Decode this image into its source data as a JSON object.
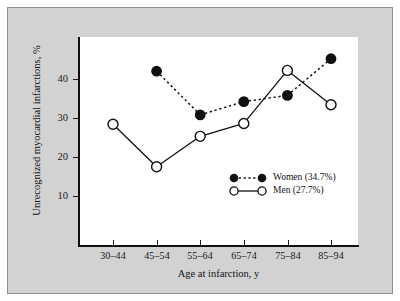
{
  "chart_data": {
    "type": "line",
    "title": "",
    "xlabel": "Age at infarction, y",
    "ylabel": "Unrecognized myocardial infarctions, %",
    "categories": [
      "30–44",
      "45–54",
      "55–64",
      "65–74",
      "75–84",
      "85–94"
    ],
    "yticks": [
      10,
      20,
      30,
      40
    ],
    "ylim": [
      0,
      50
    ],
    "grid": false,
    "legend_position": "inside-right-lower",
    "series": [
      {
        "name": "Women (34.7%)",
        "short_name": "Women",
        "overall": "34.7%",
        "marker": "filled-circle",
        "linestyle": "dotted",
        "color": "#111111",
        "values": [
          null,
          42.0,
          30.8,
          34.2,
          35.8,
          45.2
        ]
      },
      {
        "name": "Men (27.7%)",
        "short_name": "Men",
        "overall": "27.7%",
        "marker": "open-circle",
        "linestyle": "solid",
        "color": "#111111",
        "values": [
          28.4,
          17.5,
          25.3,
          28.6,
          42.2,
          33.4
        ]
      }
    ]
  },
  "legend": {
    "items": [
      {
        "label": "Women (34.7%)"
      },
      {
        "label": "Men (27.7%)"
      }
    ]
  },
  "colors": {
    "figure_background": "#d2d2d2",
    "plot_background": "#ffffff",
    "ink": "#111111",
    "frame": "#8e8e8e"
  }
}
